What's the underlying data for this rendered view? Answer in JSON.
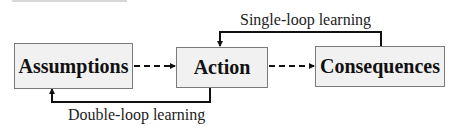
{
  "diagram": {
    "nodes": [
      {
        "id": "assumptions",
        "label": "Assumptions"
      },
      {
        "id": "action",
        "label": "Action"
      },
      {
        "id": "consequences",
        "label": "Consequences"
      }
    ],
    "edges": [
      {
        "from": "assumptions",
        "to": "action",
        "style": "dashed"
      },
      {
        "from": "action",
        "to": "consequences",
        "style": "dashed"
      },
      {
        "from": "consequences",
        "to": "action",
        "style": "solid",
        "label": "Single-loop learning"
      },
      {
        "from": "action",
        "to": "assumptions",
        "style": "solid",
        "label": "Double-loop learning"
      }
    ],
    "labels": {
      "single_loop": "Single-loop learning",
      "double_loop": "Double-loop learning"
    },
    "colors": {
      "box_fill": "#f1f1f1",
      "box_border": "#7a7a7a",
      "line": "#111111"
    }
  }
}
